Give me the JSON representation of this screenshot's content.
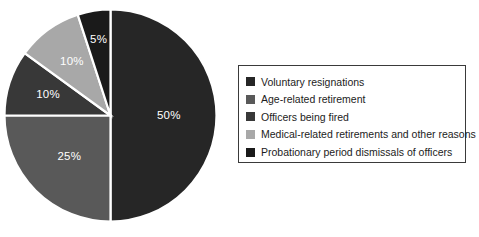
{
  "chart_data": {
    "type": "pie",
    "title": "",
    "categories": [
      "Voluntary resignations",
      "Age-related retirement",
      "Officers being fired",
      "Medical-related retirements and other reasons",
      "Probationary period dismissals of officers"
    ],
    "values": [
      50,
      25,
      10,
      10,
      5
    ],
    "data_labels": [
      "50%",
      "25%",
      "10%",
      "10%",
      "5%"
    ],
    "colors": [
      "#262626",
      "#595959",
      "#383838",
      "#a8a8a8",
      "#1a1a1a"
    ],
    "label_colors": [
      "#ffffff",
      "#ffffff",
      "#ffffff",
      "#ffffff",
      "#ffffff"
    ],
    "start_angle_deg": 0,
    "direction": "clockwise",
    "legend_position": "right",
    "legend_border_color": "#3a3a3a",
    "slice_border_color": "#ffffff",
    "grid": false
  },
  "legend": {
    "items": [
      {
        "label": "Voluntary resignations",
        "color": "#262626"
      },
      {
        "label": "Age-related retirement",
        "color": "#595959"
      },
      {
        "label": "Officers being fired",
        "color": "#383838"
      },
      {
        "label": "Medical-related retirements and other reasons",
        "color": "#a8a8a8"
      },
      {
        "label": "Probationary period dismissals of officers",
        "color": "#1a1a1a"
      }
    ]
  },
  "pie": {
    "slices": [
      {
        "name": "voluntary-resignations",
        "label": "50%",
        "color": "#262626"
      },
      {
        "name": "age-related-retirement",
        "label": "25%",
        "color": "#595959"
      },
      {
        "name": "officers-being-fired",
        "label": "10%",
        "color": "#383838"
      },
      {
        "name": "medical-related-retirements",
        "label": "10%",
        "color": "#a8a8a8"
      },
      {
        "name": "probationary-dismissals",
        "label": "5%",
        "color": "#1a1a1a"
      }
    ]
  }
}
